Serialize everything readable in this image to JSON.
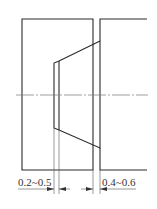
{
  "diagram": {
    "type": "mechanical-section-drawing",
    "colors": {
      "line": "#2a2a2a",
      "centerline": "#777777",
      "background": "#ffffff"
    },
    "dimensions": [
      {
        "label": "0.2~0.5",
        "position": "bottom-left"
      },
      {
        "label": "0.4~0.6",
        "position": "bottom-right"
      }
    ]
  }
}
